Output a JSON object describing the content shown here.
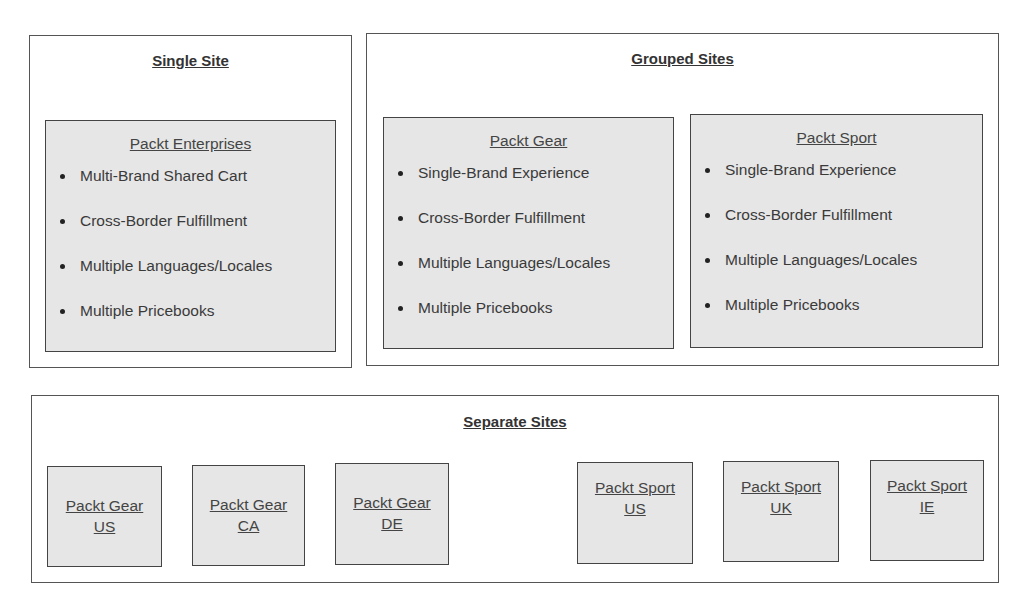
{
  "diagram": {
    "single_site": {
      "title": "Single Site",
      "panel": {
        "title": "Packt Enterprises",
        "items": [
          "Multi-Brand Shared Cart",
          "Cross-Border Fulfillment",
          "Multiple Languages/Locales",
          "Multiple Pricebooks"
        ]
      }
    },
    "grouped_sites": {
      "title": "Grouped Sites",
      "panels": [
        {
          "title": "Packt Gear",
          "items": [
            "Single-Brand Experience",
            "Cross-Border Fulfillment",
            "Multiple Languages/Locales",
            "Multiple Pricebooks"
          ]
        },
        {
          "title": "Packt Sport",
          "items": [
            "Single-Brand Experience",
            "Cross-Border Fulfillment",
            "Multiple Languages/Locales",
            "Multiple Pricebooks"
          ]
        }
      ]
    },
    "separate_sites": {
      "title": "Separate Sites",
      "sites": [
        {
          "line1": "Packt Gear",
          "line2": "US"
        },
        {
          "line1": "Packt Gear",
          "line2": "CA"
        },
        {
          "line1": "Packt Gear",
          "line2": "DE"
        },
        {
          "line1": "Packt Sport",
          "line2": "US"
        },
        {
          "line1": "Packt Sport",
          "line2": "UK"
        },
        {
          "line1": "Packt Sport",
          "line2": "IE"
        }
      ]
    }
  },
  "colors": {
    "panel_fill": "#e6e6e6",
    "border": "#444444",
    "text": "#333333"
  }
}
